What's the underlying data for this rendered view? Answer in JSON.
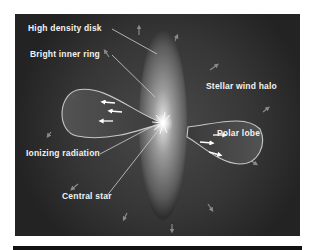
{
  "diagram": {
    "type": "planetary nebula structure illustration",
    "colors": {
      "background": "#262626",
      "label_text": "#f2f2f2",
      "disk": "#8a8a8a",
      "lobe_outline": "#d8d8d8"
    },
    "labels": {
      "high_density_disk": "High density disk",
      "bright_inner_ring": "Bright inner ring",
      "stellar_wind_halo": "Stellar wind halo",
      "polar_lobe": "Polar lobe",
      "ionizing_radiation": "Ionizing radiation",
      "central_star": "Central star"
    }
  }
}
